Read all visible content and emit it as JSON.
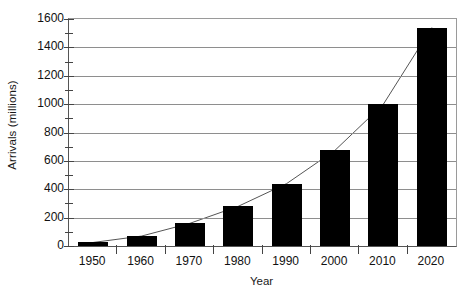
{
  "chart_data": {
    "type": "bar",
    "title": "",
    "subtitle": "",
    "xlabel": "Year",
    "ylabel": "Arrivals (millions)",
    "categories": [
      "1950",
      "1960",
      "1970",
      "1980",
      "1990",
      "2000",
      "2010",
      "2020"
    ],
    "values": [
      25,
      70,
      160,
      280,
      440,
      675,
      1000,
      1540
    ],
    "series": [
      {
        "name": "Arrivals",
        "values": [
          25,
          70,
          160,
          280,
          440,
          675,
          1000,
          1540
        ]
      }
    ],
    "overlay": {
      "type": "line",
      "name": "Trend line through bar tops",
      "values": [
        25,
        70,
        160,
        280,
        440,
        675,
        1000,
        1540
      ]
    },
    "ylim": [
      0,
      1600
    ],
    "ytick_labels": [
      "0",
      "200",
      "400",
      "600",
      "800",
      "1000",
      "1200",
      "1400",
      "1600"
    ],
    "ytick_values": [
      0,
      200,
      400,
      600,
      800,
      1000,
      1200,
      1400,
      1600
    ],
    "yminor_values": [
      100,
      300,
      500,
      700,
      900,
      1100,
      1300,
      1500
    ],
    "xtick_labels": [
      "1950",
      "1960",
      "1970",
      "1980",
      "1990",
      "2000",
      "2010",
      "2020"
    ],
    "grid": "horizontal",
    "legend": "none",
    "bar_color": "#000000",
    "line_color": "#555555",
    "grid_color": "#8e8e8e",
    "axis_color": "#444444",
    "background": "#ffffff"
  }
}
